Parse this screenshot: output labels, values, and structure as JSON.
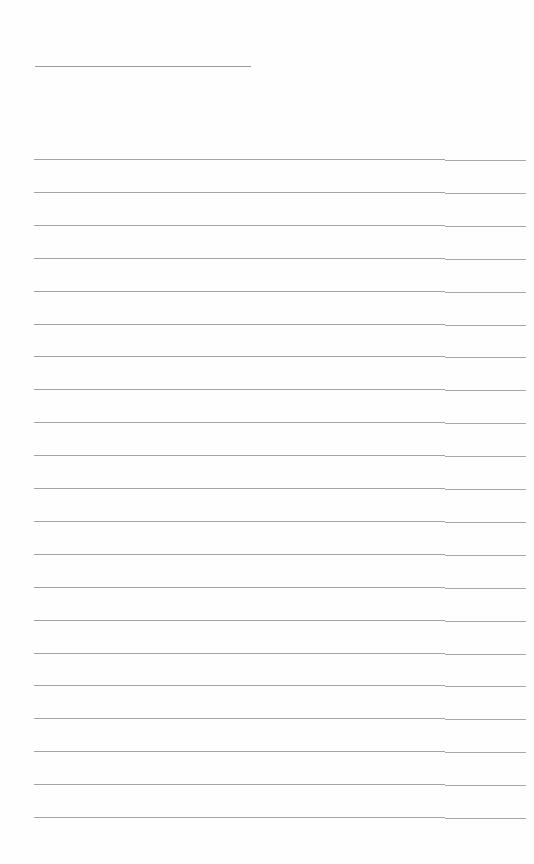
{
  "document": {
    "title_line": {
      "left": 35,
      "top": 66,
      "width": 216
    },
    "rules": {
      "count": 21,
      "first_top": 159,
      "spacing": 32.9,
      "left": 34,
      "width": 492,
      "split_at": 411
    },
    "colors": {
      "paper": "#fefefe",
      "rule": "#a4a4a4"
    }
  }
}
